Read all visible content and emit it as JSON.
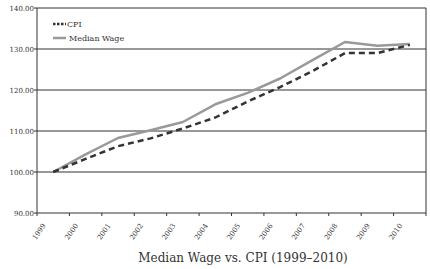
{
  "chart_data": {
    "type": "line",
    "title": "Median Wage vs. CPI (1999–2010)",
    "xlabel": "",
    "ylabel": "",
    "categories": [
      "1999",
      "2000",
      "2001",
      "2002",
      "2003",
      "2004",
      "2005",
      "2006",
      "2007",
      "2008",
      "2009",
      "2010"
    ],
    "series": [
      {
        "name": "CPI",
        "style": "dashed",
        "color": "#333333",
        "values": [
          100.0,
          103.2,
          106.3,
          108.2,
          110.6,
          113.3,
          117.2,
          120.7,
          124.6,
          129.0,
          129.0,
          131.0
        ]
      },
      {
        "name": "Median Wage",
        "style": "solid",
        "color": "#999999",
        "values": [
          100.0,
          104.3,
          108.3,
          110.2,
          112.2,
          116.5,
          119.3,
          122.8,
          127.3,
          131.7,
          130.8,
          131.2
        ]
      }
    ],
    "ylim": [
      90,
      140
    ],
    "yticks": [
      "90.00",
      "100.00",
      "110.00",
      "120.00",
      "130.00",
      "140.00"
    ],
    "grid": {
      "horizontal": true,
      "vertical": false
    },
    "legend_position": "top-left-inside"
  }
}
